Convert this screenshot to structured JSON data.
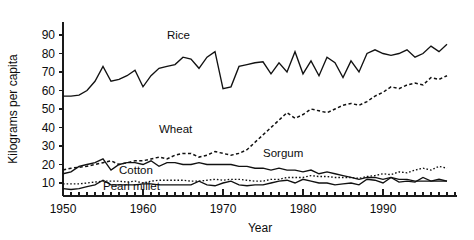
{
  "chart_data": {
    "type": "line",
    "title": "",
    "xlabel": "Year",
    "ylabel": "Kilograms per capita",
    "xlim": [
      1950,
      1999
    ],
    "ylim": [
      0,
      95
    ],
    "yticks": [
      10,
      20,
      30,
      40,
      50,
      60,
      70,
      80,
      90
    ],
    "xticks": [
      1950,
      1960,
      1970,
      1980,
      1990
    ],
    "xtick_labels": [
      "1950",
      "1960",
      "1970",
      "1980",
      "1990"
    ],
    "ytick_labels": [
      "10",
      "20",
      "30",
      "40",
      "50",
      "60",
      "70",
      "80",
      "90"
    ],
    "x_minor_tick_interval": 1,
    "grid": false,
    "legend": "inline-annotations",
    "x": [
      1950,
      1951,
      1952,
      1953,
      1954,
      1955,
      1956,
      1957,
      1958,
      1959,
      1960,
      1961,
      1962,
      1963,
      1964,
      1965,
      1966,
      1967,
      1968,
      1969,
      1970,
      1971,
      1972,
      1973,
      1974,
      1975,
      1976,
      1977,
      1978,
      1979,
      1980,
      1981,
      1982,
      1983,
      1984,
      1985,
      1986,
      1987,
      1988,
      1989,
      1990,
      1991,
      1992,
      1993,
      1994,
      1995,
      1996,
      1997,
      1998
    ],
    "series": [
      {
        "name": "Rice",
        "style": "solid",
        "label_x": 1963,
        "label_y": 88,
        "values": [
          57,
          57,
          57.5,
          60,
          65,
          73,
          65,
          66,
          68,
          71,
          62,
          68,
          72,
          73,
          74,
          78,
          77,
          72,
          78,
          81,
          61,
          62,
          73,
          74,
          75,
          75.5,
          69,
          75,
          70,
          81,
          69,
          76,
          68,
          78,
          75,
          67,
          76,
          70,
          80,
          82,
          80,
          79,
          80,
          82,
          78,
          80,
          84,
          81,
          85
        ],
        "units": "kg per capita"
      },
      {
        "name": "Wheat",
        "style": "dashed",
        "label_x": 1962,
        "label_y": 37,
        "values": [
          17,
          18,
          18.5,
          19,
          20,
          21,
          22,
          20,
          21,
          22,
          22,
          23,
          24,
          23,
          25,
          26,
          26,
          24,
          25,
          27,
          26,
          25,
          26,
          28,
          32,
          36,
          40,
          44,
          48,
          45,
          47,
          50,
          49,
          48,
          50,
          52,
          53,
          52,
          54,
          57,
          59,
          62,
          61,
          63,
          64,
          63,
          67,
          66,
          68
        ],
        "units": "kg per capita"
      },
      {
        "name": "Sorgum",
        "style": "solid",
        "label_x": 1975,
        "label_y": 24,
        "values": [
          15,
          16,
          19,
          20,
          21,
          23,
          17,
          20,
          21,
          21,
          20,
          22,
          19,
          21,
          21,
          20,
          20,
          21,
          20,
          20,
          20,
          20,
          19,
          19,
          18,
          18,
          17,
          18,
          17,
          17,
          16,
          17,
          15,
          16,
          15,
          14,
          13,
          12,
          13,
          13,
          12,
          13,
          12,
          12,
          11,
          11,
          11,
          11,
          11
        ],
        "units": "kg per capita"
      },
      {
        "name": "Cotton",
        "style": "dotted",
        "label_x": 1957,
        "label_y": 15,
        "values": [
          9.5,
          9.5,
          9.5,
          10,
          10.5,
          11,
          11,
          11,
          10.5,
          11,
          10,
          11,
          11.5,
          11.5,
          11.5,
          11.5,
          11,
          11,
          11.5,
          12,
          11.5,
          12,
          12,
          11.5,
          11,
          11,
          12,
          12,
          13,
          13,
          13,
          14,
          13.5,
          13.5,
          13,
          13,
          13,
          12.5,
          13.5,
          14,
          15,
          14.5,
          16,
          15.5,
          17,
          18,
          17,
          19,
          18
        ],
        "units": "kg per capita"
      },
      {
        "name": "Pearl millet",
        "style": "solid",
        "label_x": 1955,
        "label_y": 6,
        "values": [
          7,
          6.5,
          7,
          8,
          9,
          11.5,
          9,
          9,
          9,
          9,
          9.5,
          9.5,
          9,
          9,
          9,
          9,
          9,
          11,
          9,
          8.5,
          10,
          11,
          9,
          8.5,
          9,
          9,
          10,
          11,
          11.5,
          10,
          12,
          11,
          10,
          10,
          9,
          9.5,
          10,
          9,
          12,
          11.5,
          10,
          13,
          10.5,
          11,
          10.5,
          13,
          11,
          12,
          11
        ],
        "units": "kg per capita"
      }
    ]
  }
}
